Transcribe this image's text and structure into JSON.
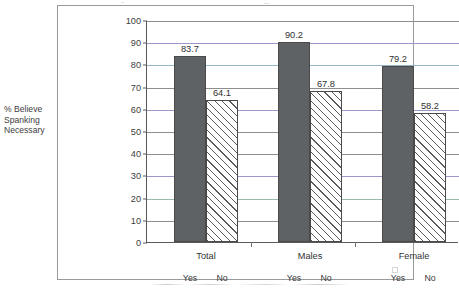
{
  "chart_data": {
    "type": "bar",
    "title": "",
    "xlabel": "",
    "ylabel": "% Believe Spanking Necessary",
    "ylim": [
      0,
      100
    ],
    "ytick_step": 10,
    "yticks": [
      "100",
      "90",
      "80",
      "70",
      "60",
      "50",
      "40",
      "30",
      "20",
      "10",
      "0"
    ],
    "grid": true,
    "legend": "none",
    "categories": [
      "Total",
      "Males",
      "Female"
    ],
    "subcategories": [
      "Yes",
      "No"
    ],
    "series": [
      {
        "name": "Yes",
        "values": [
          83.7,
          90.2,
          79.2
        ],
        "style": "solid-gray"
      },
      {
        "name": "No",
        "values": [
          64.1,
          67.8,
          58.2
        ],
        "style": "diagonal-hatch"
      }
    ],
    "data_labels": [
      "83.7",
      "64.1",
      "90.2",
      "67.8",
      "79.2",
      "58.2"
    ],
    "groups": [
      {
        "label": "Total",
        "bars": [
          {
            "tick": "Yes",
            "value_label": "83.7",
            "value": 83.7,
            "style": "solid"
          },
          {
            "tick": "No",
            "value_label": "64.1",
            "value": 64.1,
            "style": "hatch"
          }
        ]
      },
      {
        "label": "Males",
        "bars": [
          {
            "tick": "Yes",
            "value_label": "90.2",
            "value": 90.2,
            "style": "solid"
          },
          {
            "tick": "No",
            "value_label": "67.8",
            "value": 67.8,
            "style": "hatch"
          }
        ]
      },
      {
        "label": "Female",
        "bars": [
          {
            "tick": "Yes",
            "value_label": "79.2",
            "value": 79.2,
            "style": "solid"
          },
          {
            "tick": "No",
            "value_label": "58.2",
            "value": 58.2,
            "style": "hatch"
          }
        ]
      }
    ]
  },
  "colors": {
    "solid_bar": "#5f6264",
    "hatch_line": "#5a5a5a",
    "gridline": "#8e8e8e",
    "axis": "#5a5a5a",
    "frame": "#9a9a9a",
    "text": "#3a3a3a",
    "background": "#ffffff"
  }
}
